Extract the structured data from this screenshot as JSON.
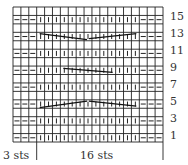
{
  "chart_data": {
    "type": "table",
    "columns": 19,
    "rows": 16,
    "row_labels": [
      "1",
      "3",
      "5",
      "7",
      "9",
      "11",
      "13",
      "15"
    ],
    "bottom_labels": {
      "edge": "3 sts",
      "repeat": "16 sts"
    },
    "legend_symbols": {
      "-": "purl",
      "I": "knit",
      "": "empty (even row)"
    },
    "odd_row_pattern": [
      "-",
      "-",
      "-",
      "I",
      "I",
      "I",
      "I",
      "I",
      "I",
      "I",
      "I",
      "I",
      "I",
      "I",
      "I",
      "I",
      "-",
      "-",
      "-"
    ],
    "even_rows_blank": true,
    "cable_rows": [
      {
        "row": 5,
        "shape": "peak",
        "span_cols": [
          4,
          16
        ]
      },
      {
        "row": 9,
        "shape": "single",
        "span_cols": [
          7,
          13
        ]
      },
      {
        "row": 13,
        "shape": "valley",
        "span_cols": [
          4,
          16
        ]
      }
    ],
    "grid": true
  },
  "labels": {
    "row_1": "1",
    "row_3": "3",
    "row_5": "5",
    "row_7": "7",
    "row_9": "9",
    "row_11": "11",
    "row_13": "13",
    "row_15": "15",
    "edge_sts": "3 sts",
    "repeat_sts": "16 sts"
  }
}
